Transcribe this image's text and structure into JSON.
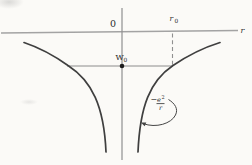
{
  "figure": {
    "type": "physics-potential-energy-diagram",
    "background": "#fbfaf7",
    "colors": {
      "curve": "#3f3f3f",
      "axis": "#a3a3a3",
      "guide": "#8c8c8c",
      "text": "#2b2b2b"
    },
    "axes": {
      "origin_label": "0",
      "x_axis_label": "r"
    },
    "annotations": {
      "r0": {
        "base": "r",
        "sub": "0"
      },
      "w0": {
        "base": "W",
        "sub": "0"
      },
      "formula": {
        "minus": "−",
        "numerator_base": "e",
        "numerator_sup": "2",
        "denominator": "r"
      }
    },
    "curve": {
      "type": "line",
      "expression_shown": "−e²/r",
      "branches": 2,
      "shape": "two symmetric hyperbola-like branches below the r axis, approaching the r axis horizontally and the vertical axis as they plunge downward",
      "marked_level": "W0 horizontal line intersecting both branches, dot where it crosses the vertical axis",
      "marked_abscissa": "r0 on the r axis with dashed vertical drop to the W0 level on the right branch"
    }
  }
}
